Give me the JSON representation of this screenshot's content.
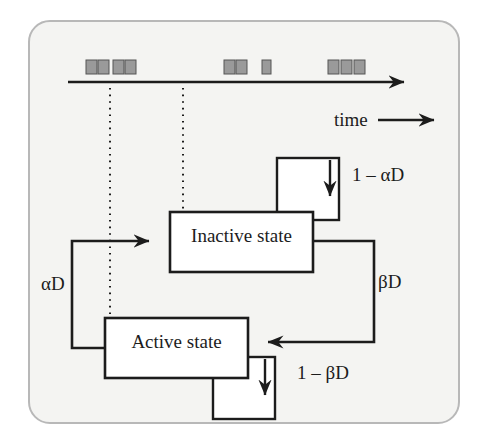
{
  "figure": {
    "background_color": "#f4f4f2",
    "frame_color": "#b8b8b8",
    "ink_color": "#1c1c1c",
    "marker_color": "#9a9a9a"
  },
  "timeline": {
    "axis_label": "time",
    "axis_y": 82,
    "axis_x_start": 68,
    "axis_x_end": 418,
    "arrow_label_y": 120,
    "event_markers": [
      {
        "x": 86,
        "y": 60,
        "w": 11,
        "h": 14
      },
      {
        "x": 98,
        "y": 60,
        "w": 11,
        "h": 14
      },
      {
        "x": 113,
        "y": 60,
        "w": 11,
        "h": 14
      },
      {
        "x": 125,
        "y": 60,
        "w": 11,
        "h": 14
      },
      {
        "x": 224,
        "y": 60,
        "w": 11,
        "h": 14
      },
      {
        "x": 236,
        "y": 60,
        "w": 11,
        "h": 14
      },
      {
        "x": 262,
        "y": 60,
        "w": 9,
        "h": 14
      },
      {
        "x": 328,
        "y": 60,
        "w": 11,
        "h": 14
      },
      {
        "x": 341,
        "y": 60,
        "w": 11,
        "h": 14
      },
      {
        "x": 354,
        "y": 60,
        "w": 11,
        "h": 14
      }
    ],
    "dropline_1_x": 110,
    "dropline_2_x": 183
  },
  "states": [
    {
      "id": "inactive",
      "label": "Inactive state",
      "x": 170,
      "y": 212,
      "width": 143,
      "height": 60,
      "self_loop_label": "1 – αD"
    },
    {
      "id": "active",
      "label": "Active state",
      "x": 105,
      "y": 318,
      "width": 143,
      "height": 60,
      "self_loop_label": "1 – βD"
    }
  ],
  "transitions": [
    {
      "id": "active-to-inactive",
      "label": "αD",
      "from": "active",
      "to": "inactive"
    },
    {
      "id": "inactive-to-active",
      "label": "βD",
      "from": "inactive",
      "to": "active"
    }
  ],
  "labels": {
    "time": "time",
    "one_minus_alpha_d": "1 – αD",
    "one_minus_beta_d": "1 – βD",
    "alpha_d": "αD",
    "beta_d": "βD",
    "inactive_state": "Inactive state",
    "active_state": "Active state"
  }
}
